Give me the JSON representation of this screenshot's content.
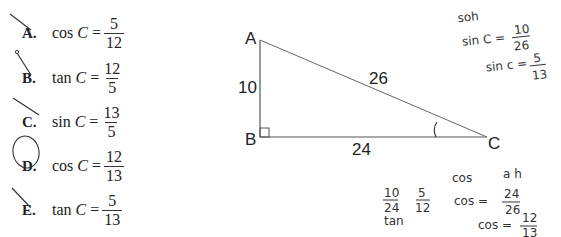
{
  "choices": [
    {
      "letter": "A.",
      "fn": "cos",
      "var": "C",
      "eq": "=",
      "num": "5",
      "den": "12",
      "mark": "crossed"
    },
    {
      "letter": "B.",
      "fn": "tan",
      "var": "C",
      "eq": "=",
      "num": "12",
      "den": "5",
      "mark": "crossed"
    },
    {
      "letter": "C.",
      "fn": "sin",
      "var": "C",
      "eq": "=",
      "num": "13",
      "den": "5",
      "mark": "crossed"
    },
    {
      "letter": "D.",
      "fn": "cos",
      "var": "C",
      "eq": "=",
      "num": "12",
      "den": "13",
      "mark": "circled"
    },
    {
      "letter": "E.",
      "fn": "tan",
      "var": "C",
      "eq": "=",
      "num": "5",
      "den": "13",
      "mark": "crossed"
    }
  ],
  "triangle": {
    "vertices": {
      "A": "A",
      "B": "B",
      "C": "C"
    },
    "sides": {
      "AB": "10",
      "BC": "24",
      "AC": "26"
    },
    "right_angle_at": "B",
    "marked_angle_at": "C"
  },
  "handwriting": {
    "top_right": [
      "soh",
      "sin C = 10/26",
      "sin C = 5/13"
    ],
    "bottom_left": [
      "10/24",
      "tan",
      "5/12"
    ],
    "bottom_right": [
      "cos  a h",
      "cos = 24/26",
      "cos = 12/13"
    ]
  }
}
